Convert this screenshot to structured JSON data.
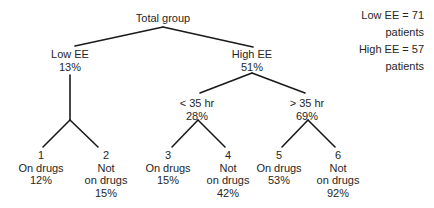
{
  "root": {
    "label": "Total group"
  },
  "level1": [
    {
      "label": "Low EE",
      "value": "13%"
    },
    {
      "label": "High EE",
      "value": "51%"
    }
  ],
  "level2": [
    {
      "label": "< 35 hr",
      "value": "28%"
    },
    {
      "label": "> 35 hr",
      "value": "69%"
    }
  ],
  "leaves": [
    {
      "number": "1",
      "line1": "On drugs",
      "line2": "12%",
      "line3": ""
    },
    {
      "number": "2",
      "line1": "Not",
      "line2": "on drugs",
      "line3": "15%"
    },
    {
      "number": "3",
      "line1": "On drugs",
      "line2": "15%",
      "line3": ""
    },
    {
      "number": "4",
      "line1": "Not",
      "line2": "on drugs",
      "line3": "42%"
    },
    {
      "number": "5",
      "line1": "On drugs",
      "line2": "53%",
      "line3": ""
    },
    {
      "number": "6",
      "line1": "Not",
      "line2": "on drugs",
      "line3": "92%"
    }
  ],
  "legend": {
    "low": "Low EE = 71 patients",
    "high": "High EE = 57 patients"
  },
  "colors": {
    "line": "#1a1a1a",
    "text": "#262626"
  }
}
